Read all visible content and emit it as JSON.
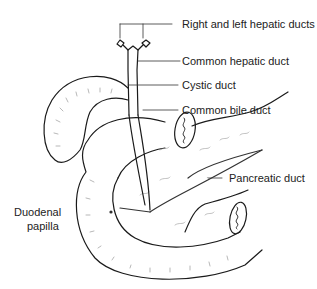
{
  "diagram": {
    "labels": {
      "right_left_hepatic": "Right and left hepatic ducts",
      "common_hepatic": "Common hepatic duct",
      "cystic": "Cystic duct",
      "common_bile": "Common bile duct",
      "pancreatic": "Pancreatic duct",
      "duodenal_papilla_line1": "Duodenal",
      "duodenal_papilla_line2": "papilla"
    },
    "colors": {
      "line": "#1a1a1a",
      "detail": "#777777",
      "background": "#ffffff"
    }
  }
}
